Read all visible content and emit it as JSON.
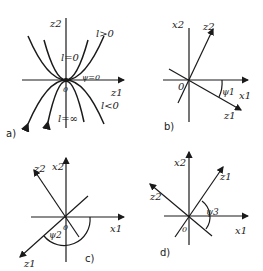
{
  "figure": {
    "panels": [
      {
        "id": "a",
        "caption": "a)",
        "axis_labels": {
          "vertical": "z2",
          "horizontal": "z1"
        },
        "origin_label": "0",
        "curve_labels": {
          "l_zero": "l=0",
          "l_pos": "l>0",
          "l_neg": "l<0",
          "l_inf": "l=∞"
        },
        "angle_label": "ψ=0"
      },
      {
        "id": "b",
        "caption": "b)",
        "axis_labels": {
          "vertical": "x2",
          "horizontal": "x1",
          "line_up": "z2",
          "line_down": "z1"
        },
        "origin_label": "0",
        "angle_label": "ψ1"
      },
      {
        "id": "c",
        "caption": "c)",
        "axis_labels": {
          "vertical": "x2",
          "horizontal": "x1",
          "line_up": "z2",
          "line_down": "z1"
        },
        "origin_label": "0",
        "angle_label": "ψ2"
      },
      {
        "id": "d",
        "caption": "d)",
        "axis_labels": {
          "vertical": "x2",
          "horizontal": "x1",
          "line_up": "z1",
          "line_down": "z2"
        },
        "origin_label": "0",
        "angle_label": "ψ3"
      }
    ]
  }
}
